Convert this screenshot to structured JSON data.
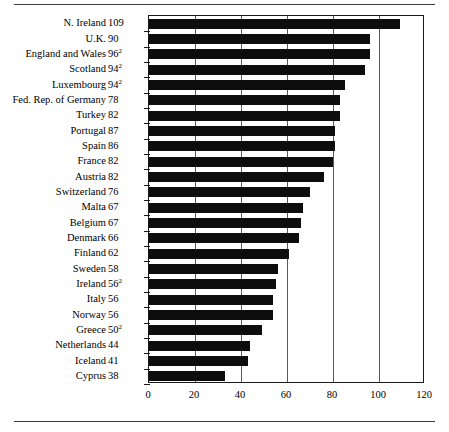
{
  "chart_data": {
    "type": "bar",
    "orientation": "horizontal",
    "title": "",
    "subtitle": "",
    "xlabel": "",
    "ylabel": "",
    "xlim": [
      0,
      120
    ],
    "xticks": [
      0,
      20,
      40,
      60,
      80,
      100,
      120
    ],
    "xtick_labels": [
      "0",
      "20",
      "40",
      "60",
      "80",
      "100",
      "120"
    ],
    "grid": "vertical",
    "legend": "none",
    "bar_color": "#0d0d0d",
    "categories": [
      "N. Ireland",
      "U.K.",
      "England and Wales",
      "Scotland",
      "Luxembourg",
      "Fed. Rep. of Germany",
      "Turkey",
      "Portugal",
      "Spain",
      "France",
      "Austria",
      "Switzerland",
      "Malta",
      "Belgium",
      "Denmark",
      "Finland",
      "Sweden",
      "Ireland",
      "Italy",
      "Norway",
      "Greece",
      "Netherlands",
      "Iceland",
      "Cyprus"
    ],
    "value_labels": [
      "109",
      "90",
      "96",
      "94",
      "94",
      "78",
      "82",
      "87",
      "86",
      "82",
      "82",
      "76",
      "67",
      "67",
      "66",
      "62",
      "58",
      "56",
      "56",
      "56",
      "50",
      "44",
      "41",
      "38"
    ],
    "value_footnotes": [
      "",
      "",
      "2",
      "2",
      "2",
      "",
      "",
      "",
      "",
      "",
      "",
      "",
      "",
      "",
      "",
      "",
      "",
      "2",
      "",
      "",
      "2",
      "",
      "",
      ""
    ],
    "values": [
      109,
      96,
      96,
      94,
      85,
      83,
      83,
      81,
      81,
      80,
      76,
      70,
      67,
      66,
      65,
      61,
      56,
      55,
      54,
      54,
      49,
      44,
      43,
      33
    ],
    "rows": [
      {
        "category": "N. Ireland",
        "label": "109",
        "footnote": "",
        "value": 109
      },
      {
        "category": "U.K.",
        "label": "90",
        "footnote": "",
        "value": 96
      },
      {
        "category": "England and Wales",
        "label": "96",
        "footnote": "2",
        "value": 96
      },
      {
        "category": "Scotland",
        "label": "94",
        "footnote": "2",
        "value": 94
      },
      {
        "category": "Luxembourg",
        "label": "94",
        "footnote": "2",
        "value": 85
      },
      {
        "category": "Fed. Rep. of Germany",
        "label": "78",
        "footnote": "",
        "value": 83
      },
      {
        "category": "Turkey",
        "label": "82",
        "footnote": "",
        "value": 83
      },
      {
        "category": "Portugal",
        "label": "87",
        "footnote": "",
        "value": 81
      },
      {
        "category": "Spain",
        "label": "86",
        "footnote": "",
        "value": 81
      },
      {
        "category": "France",
        "label": "82",
        "footnote": "",
        "value": 80
      },
      {
        "category": "Austria",
        "label": "82",
        "footnote": "",
        "value": 76
      },
      {
        "category": "Switzerland",
        "label": "76",
        "footnote": "",
        "value": 70
      },
      {
        "category": "Malta",
        "label": "67",
        "footnote": "",
        "value": 67
      },
      {
        "category": "Belgium",
        "label": "67",
        "footnote": "",
        "value": 66
      },
      {
        "category": "Denmark",
        "label": "66",
        "footnote": "",
        "value": 65
      },
      {
        "category": "Finland",
        "label": "62",
        "footnote": "",
        "value": 61
      },
      {
        "category": "Sweden",
        "label": "58",
        "footnote": "",
        "value": 56
      },
      {
        "category": "Ireland",
        "label": "56",
        "footnote": "2",
        "value": 55
      },
      {
        "category": "Italy",
        "label": "56",
        "footnote": "",
        "value": 54
      },
      {
        "category": "Norway",
        "label": "56",
        "footnote": "",
        "value": 54
      },
      {
        "category": "Greece",
        "label": "50",
        "footnote": "2",
        "value": 49
      },
      {
        "category": "Netherlands",
        "label": "44",
        "footnote": "",
        "value": 44
      },
      {
        "category": "Iceland",
        "label": "41",
        "footnote": "",
        "value": 43
      },
      {
        "category": "Cyprus",
        "label": "38",
        "footnote": "",
        "value": 33
      }
    ]
  }
}
